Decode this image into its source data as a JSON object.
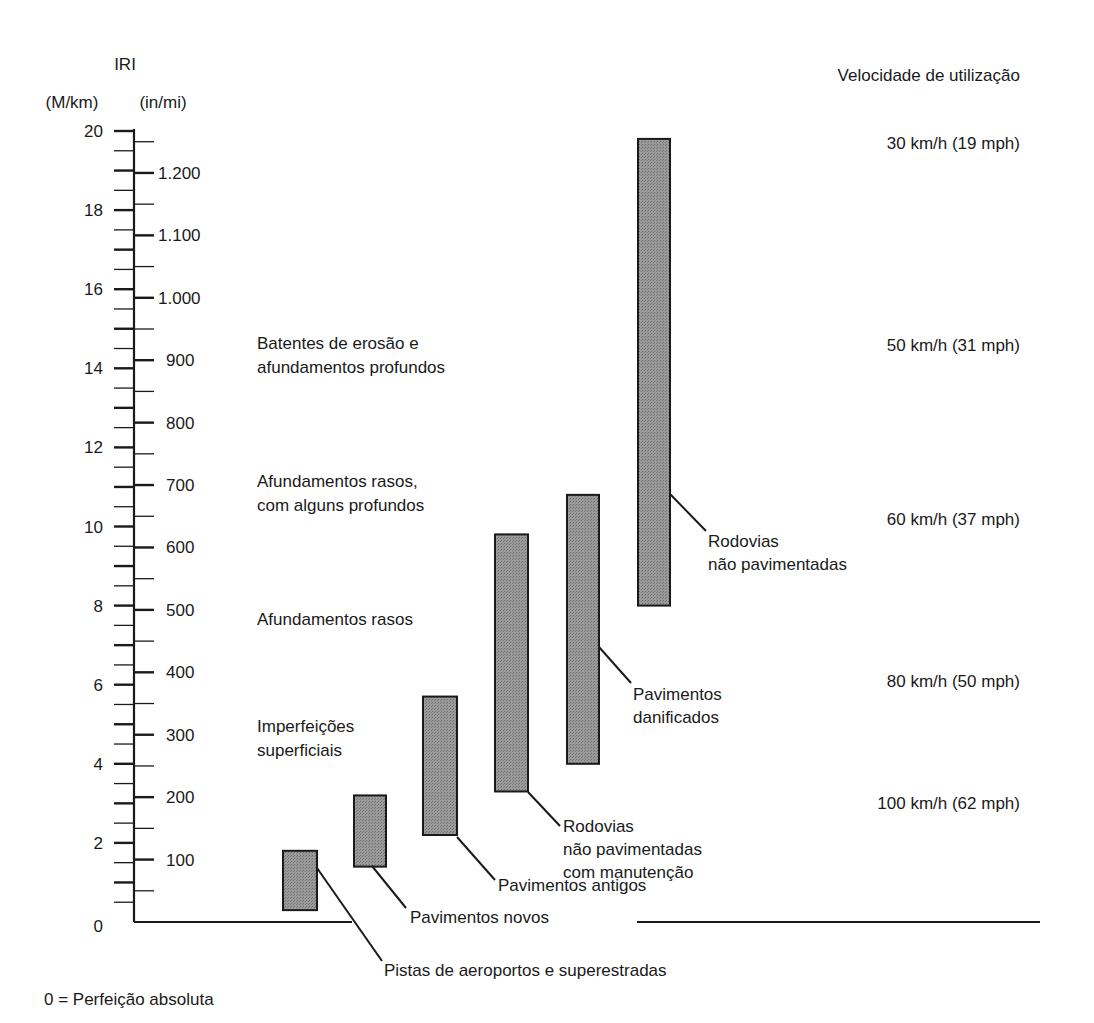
{
  "chart_data": {
    "type": "bar",
    "subtype": "floating-range",
    "title": "IRI",
    "left_axis": {
      "label": "(M/km)",
      "ticks": [
        0,
        2,
        4,
        6,
        8,
        10,
        12,
        14,
        16,
        18,
        20
      ],
      "range": [
        0,
        20
      ]
    },
    "right_axis": {
      "label": "(in/mi)",
      "ticks": [
        "100",
        "200",
        "300",
        "400",
        "500",
        "600",
        "700",
        "800",
        "900",
        "1.000",
        "1.100",
        "1.200"
      ],
      "tick_values": [
        100,
        200,
        300,
        400,
        500,
        600,
        700,
        800,
        900,
        1000,
        1100,
        1200
      ]
    },
    "baseline_note": "0 = Perfeição absoluta",
    "series": [
      {
        "name": "Pistas de aeroportos e superestradas",
        "low": 0.3,
        "high": 1.8
      },
      {
        "name": "Pavimentos novos",
        "low": 1.4,
        "high": 3.2
      },
      {
        "name": "Pavimentos antigos",
        "low": 2.2,
        "high": 5.7
      },
      {
        "name": "Rodovias não pavimentadas com manutenção",
        "low": 3.3,
        "high": 9.8
      },
      {
        "name": "Pavimentos danificados",
        "low": 4.0,
        "high": 10.8
      },
      {
        "name": "Rodovias não pavimentadas",
        "low": 8.0,
        "high": 19.8
      }
    ],
    "condition_labels": [
      {
        "text": [
          "Batentes de erosão e",
          "afundamentos profundos"
        ],
        "at": 14.5
      },
      {
        "text": [
          "Afundamentos rasos,",
          "com alguns profundos"
        ],
        "at": 11.0
      },
      {
        "text": [
          "Afundamentos rasos"
        ],
        "at": 7.5
      },
      {
        "text": [
          "Imperfeições",
          "superficiais"
        ],
        "at": 4.8
      }
    ],
    "speed_header": "Velocidade de utilização",
    "speeds": [
      {
        "text": "30 km/h (19 mph)",
        "at": 19.7
      },
      {
        "text": "50 km/h (31 mph)",
        "at": 14.6
      },
      {
        "text": "60 km/h (37 mph)",
        "at": 10.2
      },
      {
        "text": "80 km/h (50 mph)",
        "at": 6.1
      },
      {
        "text": "100 km/h (62 mph)",
        "at": 3.0
      }
    ],
    "grid": false,
    "colors": {
      "bar_fill": "#8c8c8c",
      "bar_stroke": "#1a1a1a",
      "ink": "#1a1a1a"
    }
  },
  "labels": {
    "title": "IRI",
    "left_unit": "(M/km)",
    "right_unit": "(in/mi)",
    "speed_header": "Velocidade de utilização",
    "baseline_note": "0 = Perfeição absoluta",
    "bar_labels": [
      [
        "Pistas de aeroportos e superestradas"
      ],
      [
        "Pavimentos novos"
      ],
      [
        "Pavimentos antigos"
      ],
      [
        "Rodovias",
        "não pavimentadas",
        "com manutenção"
      ],
      [
        "Pavimentos",
        "danificados"
      ],
      [
        "Rodovias",
        "não pavimentadas"
      ]
    ]
  }
}
